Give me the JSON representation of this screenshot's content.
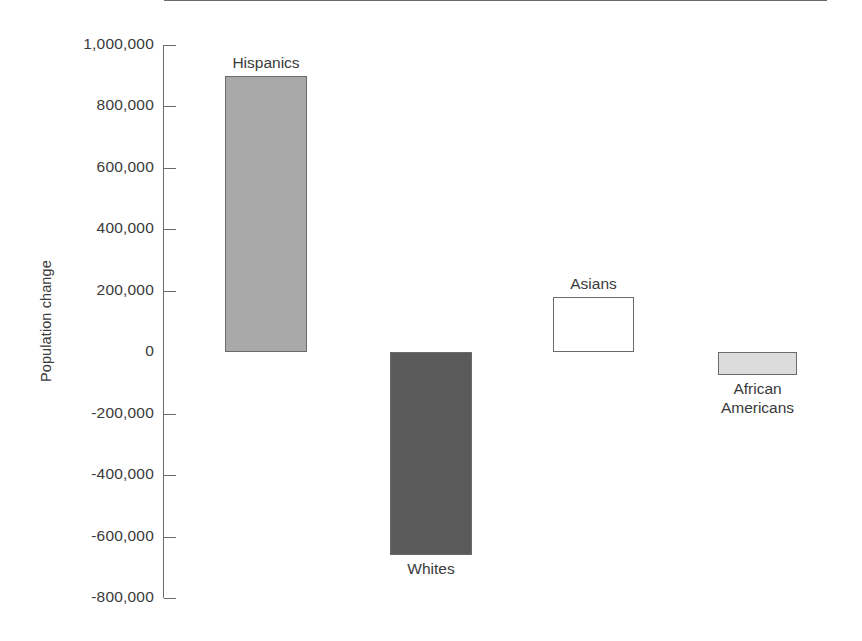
{
  "chart_data": {
    "type": "bar",
    "title": "",
    "xlabel": "",
    "ylabel": "Population change",
    "categories": [
      "Hispanics",
      "Whites",
      "Asians",
      "African\nAmericans"
    ],
    "values": [
      900000,
      -660000,
      180000,
      -75000
    ],
    "ylim": [
      -800000,
      1000000
    ],
    "ytick_values": [
      1000000,
      800000,
      600000,
      400000,
      200000,
      0,
      -200000,
      -400000,
      -600000,
      -800000
    ],
    "ytick_labels": [
      "1,000,000",
      "800,000",
      "600,000",
      "400,000",
      "200,000",
      "0",
      "-200,000",
      "-400,000",
      "-600,000",
      "-800,000"
    ],
    "grid": false,
    "legend": "none",
    "bar_fill_colors": [
      "#a9a9a9",
      "#5a5a5a",
      "#ffffff",
      "#dcdcdc"
    ],
    "bar_edge_color": "#6b6b6b",
    "axis_color": "#6b6b6b",
    "text_color": "#3a3a3a",
    "label_positions": [
      "above",
      "below",
      "above",
      "below"
    ]
  }
}
